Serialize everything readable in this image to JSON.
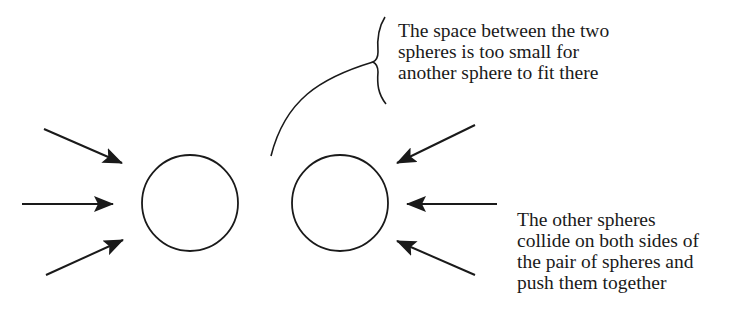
{
  "diagram": {
    "colors": {
      "stroke": "#1a1a1a",
      "background": "#ffffff"
    },
    "annotation_top": {
      "lines": [
        "The space between the two",
        "spheres is too small for",
        "another sphere to fit there"
      ]
    },
    "annotation_bottom": {
      "lines": [
        "The other spheres",
        "collide on both sides of",
        "the pair of spheres and",
        "push them together"
      ]
    },
    "spheres": [
      {
        "name": "left-sphere",
        "cx": 190,
        "cy": 203,
        "r": 48
      },
      {
        "name": "right-sphere",
        "cx": 340,
        "cy": 203,
        "r": 48
      }
    ],
    "arrows_left": [
      {
        "x1": 44,
        "y1": 129,
        "x2": 122,
        "y2": 163
      },
      {
        "x1": 22,
        "y1": 204,
        "x2": 113,
        "y2": 204
      },
      {
        "x1": 46,
        "y1": 275,
        "x2": 123,
        "y2": 240
      }
    ],
    "arrows_right": [
      {
        "x1": 475,
        "y1": 125,
        "x2": 397,
        "y2": 163
      },
      {
        "x1": 497,
        "y1": 204,
        "x2": 407,
        "y2": 204
      },
      {
        "x1": 475,
        "y1": 275,
        "x2": 397,
        "y2": 241
      }
    ]
  }
}
